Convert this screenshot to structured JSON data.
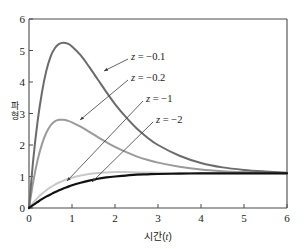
{
  "figure": {
    "background": "#ffffff",
    "frame_color": "#4a4a4a"
  },
  "axes": {
    "x_title_text": "시간(",
    "x_title_var": "t",
    "x_title_close": ")",
    "y_title_char1": "파",
    "y_title_char2": "형",
    "x_ticks": [
      "0",
      "1",
      "2",
      "3",
      "4",
      "5",
      "6"
    ],
    "y_ticks": [
      "0",
      "1",
      "2",
      "3",
      "4",
      "5",
      "6"
    ],
    "x_origin_label": "0",
    "y_origin_label": "0"
  },
  "annotations": [
    {
      "name": "z-minus-0-1",
      "prefix": "z",
      "eq": " = ",
      "value": "−0.1",
      "color": "#6b6b6b"
    },
    {
      "name": "z-minus-0-2",
      "prefix": "z",
      "eq": " = ",
      "value": "−0.2",
      "color": "#9a9a9a"
    },
    {
      "name": "z-minus-1",
      "prefix": "z",
      "eq": " = ",
      "value": "−1",
      "color": "#c9c9c9"
    },
    {
      "name": "z-minus-2",
      "prefix": "z",
      "eq": " = ",
      "value": "−2",
      "color": "#111111"
    }
  ],
  "chart_data": {
    "type": "line",
    "title": "",
    "xlabel": "시간(t)",
    "ylabel": "파형",
    "xlim": [
      0,
      6
    ],
    "ylim": [
      0,
      6
    ],
    "xticks": [
      0,
      1,
      2,
      3,
      4,
      5,
      6
    ],
    "yticks": [
      0,
      1,
      2,
      3,
      4,
      5,
      6
    ],
    "grid": false,
    "legend_position": "inline-annotations",
    "x": [
      0,
      0.1,
      0.2,
      0.3,
      0.4,
      0.5,
      0.6,
      0.7,
      0.8,
      0.9,
      1.0,
      1.2,
      1.4,
      1.6,
      1.8,
      2.0,
      2.25,
      2.5,
      2.75,
      3.0,
      3.5,
      4.0,
      4.5,
      5.0,
      5.5,
      6.0
    ],
    "series": [
      {
        "name": "z = -0.1",
        "label": "z = −0.1",
        "color": "#6b6b6b",
        "width": 2.0,
        "peak_x": 0.8,
        "peak_y": 5.25,
        "final_y": 1.12,
        "values": [
          0,
          1.55,
          2.75,
          3.66,
          4.34,
          4.8,
          5.07,
          5.21,
          5.25,
          5.22,
          5.13,
          4.85,
          4.48,
          4.08,
          3.68,
          3.3,
          2.89,
          2.53,
          2.24,
          2.0,
          1.66,
          1.43,
          1.29,
          1.21,
          1.16,
          1.12
        ]
      },
      {
        "name": "z = -0.2",
        "label": "z = −0.2",
        "color": "#9a9a9a",
        "width": 2.0,
        "peak_x": 0.8,
        "peak_y": 2.8,
        "final_y": 1.11,
        "values": [
          0,
          0.85,
          1.52,
          2.02,
          2.38,
          2.62,
          2.75,
          2.8,
          2.8,
          2.77,
          2.72,
          2.58,
          2.42,
          2.25,
          2.09,
          1.94,
          1.78,
          1.64,
          1.53,
          1.44,
          1.31,
          1.22,
          1.17,
          1.14,
          1.12,
          1.11
        ]
      },
      {
        "name": "z = -1",
        "label": "z = −1",
        "color": "#c9c9c9",
        "width": 2.0,
        "peak_x": 1.6,
        "peak_y": 1.14,
        "final_y": 1.1,
        "values": [
          0,
          0.17,
          0.32,
          0.45,
          0.56,
          0.66,
          0.74,
          0.81,
          0.87,
          0.92,
          0.96,
          1.03,
          1.08,
          1.11,
          1.13,
          1.14,
          1.14,
          1.13,
          1.13,
          1.12,
          1.11,
          1.11,
          1.1,
          1.1,
          1.1,
          1.1
        ]
      },
      {
        "name": "z = -2",
        "label": "z = −2",
        "color": "#111111",
        "width": 2.2,
        "peak_x": 6.0,
        "peak_y": 1.1,
        "final_y": 1.1,
        "values": [
          0,
          0.1,
          0.19,
          0.28,
          0.36,
          0.43,
          0.5,
          0.56,
          0.62,
          0.67,
          0.72,
          0.8,
          0.87,
          0.93,
          0.97,
          1.0,
          1.03,
          1.06,
          1.07,
          1.08,
          1.09,
          1.1,
          1.1,
          1.1,
          1.1,
          1.1
        ]
      }
    ]
  }
}
